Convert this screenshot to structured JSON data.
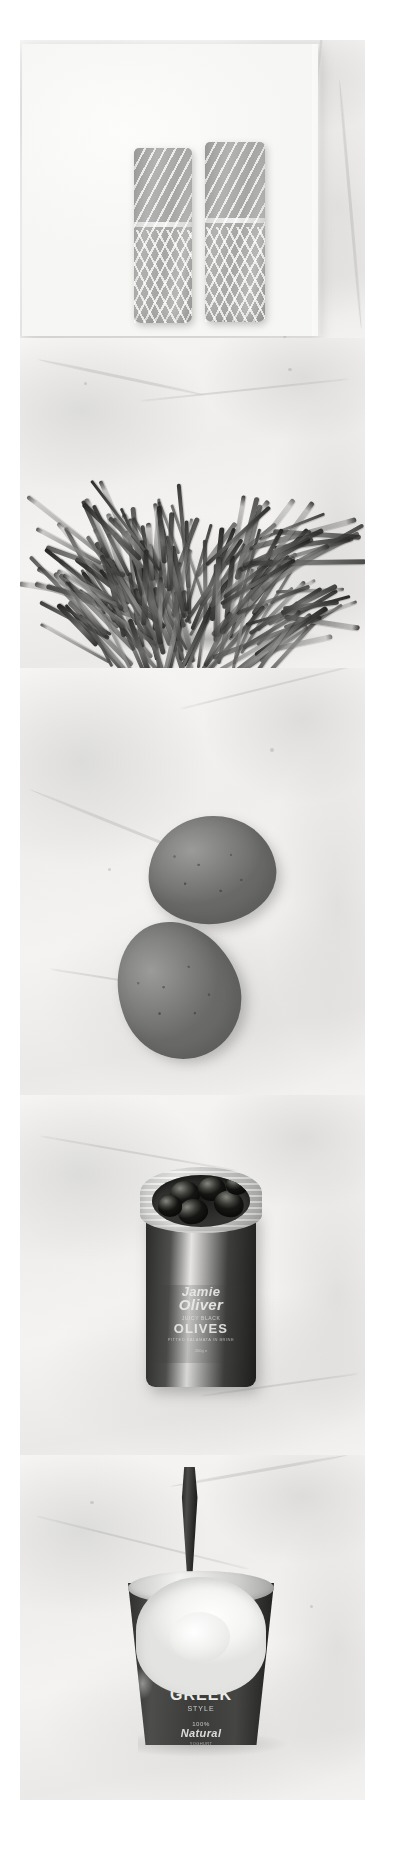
{
  "page": {
    "layout": "vertical-photo-strip",
    "treatment": "black-and-white",
    "width_px": 398,
    "height_px": 1856,
    "background_color": "#ffffff",
    "surface": "white marble slab"
  },
  "panels": [
    {
      "id": "salmon",
      "index": 1,
      "caption": "Two salmon fillets on parchment paper",
      "subject": "salmon fillets",
      "count": 2,
      "surface": "parchment paper on marble",
      "items": [
        {
          "name": "salmon-fillet-left"
        },
        {
          "name": "salmon-fillet-right"
        }
      ]
    },
    {
      "id": "green-beans",
      "index": 2,
      "caption": "A pile of fresh green beans on marble",
      "subject": "green beans",
      "count": 1,
      "surface": "marble"
    },
    {
      "id": "eggs",
      "index": 3,
      "caption": "Two speckled eggs on marble",
      "subject": "eggs",
      "count": 2,
      "surface": "marble",
      "items": [
        {
          "name": "egg-top"
        },
        {
          "name": "egg-bottom"
        }
      ]
    },
    {
      "id": "olives",
      "index": 4,
      "caption": "An open jar of black olives on marble",
      "subject": "jar of olives",
      "surface": "marble",
      "label": {
        "brand_line_1": "Jamie",
        "brand_line_2": "Oliver",
        "descriptor": "JUICY BLACK",
        "product": "OLIVES",
        "sub": "PITTED KALAMATA IN BRINE",
        "weight": "200g e"
      }
    },
    {
      "id": "yogurt",
      "index": 5,
      "caption": "A pot of Greek yoghurt with a spoon standing in it",
      "subject": "yoghurt pot with spoon",
      "surface": "marble",
      "label": {
        "line_1": "GREEK",
        "line_2": "STYLE",
        "line_3": "100%",
        "line_4": "Natural",
        "line_5": "YOGHURT"
      }
    }
  ],
  "colors": {
    "page_background": "#ffffff",
    "marble_light": "#f6f5f3",
    "marble_mid": "#eae9e7",
    "marble_shadow": "#cbcbc9",
    "salmon_flesh": "#a6a6a4",
    "bean_dark": "#2e2e2c",
    "egg_shell": "#7e7e7c",
    "jar_dark": "#2b2b29",
    "yogurt_white": "#ffffff",
    "label_text": "#e9e9e7"
  }
}
